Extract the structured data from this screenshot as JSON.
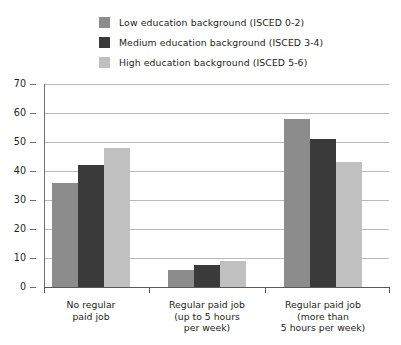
{
  "chart_data": {
    "type": "bar",
    "title": "",
    "xlabel": "",
    "ylabel": "",
    "ylim": [
      0,
      70
    ],
    "yticks": [
      "0",
      "10",
      "20",
      "30",
      "40",
      "50",
      "60",
      "70"
    ],
    "grid": true,
    "legend_position": "top",
    "categories": [
      "No regular\npaid job",
      "Regular paid job\n(up to 5 hours\nper week)",
      "Regular paid job\n(more than\n5 hours per week)"
    ],
    "category_lines": [
      [
        "No regular",
        "paid job"
      ],
      [
        "Regular paid job",
        "(up to 5 hours",
        "per week)"
      ],
      [
        "Regular paid job",
        "(more than",
        "5 hours per week)"
      ]
    ],
    "series": [
      {
        "name": "Low education background (ISCED 0-2)",
        "color": "#8c8c8c",
        "values": [
          36,
          6,
          58
        ]
      },
      {
        "name": "Medium education background (ISCED 3-4)",
        "color": "#3a3a3a",
        "values": [
          42,
          7.5,
          51
        ]
      },
      {
        "name": "High education background (ISCED 5-6)",
        "color": "#c0c0c0",
        "values": [
          48,
          9,
          43
        ]
      }
    ]
  },
  "legend": {
    "items": [
      {
        "label": "Low education background (ISCED 0-2)",
        "color": "#8c8c8c"
      },
      {
        "label": "Medium education background (ISCED 3-4)",
        "color": "#3a3a3a"
      },
      {
        "label": "High education background (ISCED 5-6)",
        "color": "#c0c0c0"
      }
    ]
  },
  "axis": {
    "y_tick_labels": [
      "70",
      "60",
      "50",
      "40",
      "30",
      "20",
      "10",
      "0"
    ]
  }
}
